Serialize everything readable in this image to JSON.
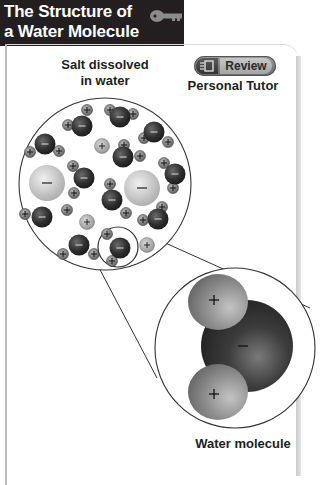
{
  "header": {
    "title_line1": "The Structure of",
    "title_line2": "a Water Molecule",
    "icon": "key-icon"
  },
  "review_button": {
    "label": "Review",
    "icon": "presentation-screen-icon"
  },
  "labels": {
    "salt": "Salt dissolved in water",
    "salt_line1": "Salt dissolved",
    "salt_line2": "in water",
    "tutor": "Personal Tutor",
    "water_molecule": "Water molecule"
  },
  "symbols": {
    "positive": "+",
    "negative": "−"
  },
  "colors": {
    "title_bg": "#231f20",
    "title_text": "#ffffff",
    "oxygen": "#3a3a3a",
    "hydrogen": "#8a8a8a",
    "chloride_ion": "#c8c8c8",
    "sodium_ion": "#a8a8a8"
  }
}
